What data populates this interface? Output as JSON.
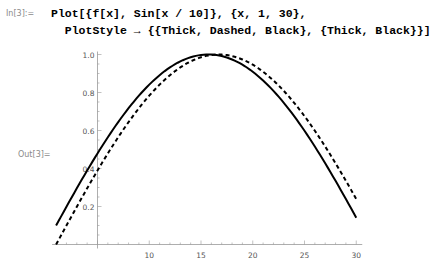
{
  "cell": {
    "input_label": "In[3]:=",
    "output_label": "Out[3]=",
    "code_line1": [
      {
        "t": "Plot[{",
        "k": true
      },
      {
        "t": "f[",
        "k": true
      },
      {
        "t": "x",
        "k": false
      },
      {
        "t": "], ",
        "k": true
      },
      {
        "t": "Sin[",
        "k": true
      },
      {
        "t": "x / 10",
        "k": false
      },
      {
        "t": "]}, {",
        "k": true
      },
      {
        "t": "x",
        "k": false
      },
      {
        "t": ", 1, 30},",
        "k": false
      }
    ],
    "code_line1_text": "Plot[{f[x], Sin[x / 10]}, {x, 1, 30},",
    "code_line2_text": "PlotStyle → {{Thick, Dashed, Black}, {Thick, Black}}]"
  },
  "chart_data": {
    "type": "line",
    "title": "",
    "xlabel": "",
    "ylabel": "",
    "xlim": [
      1,
      30
    ],
    "ylim": [
      0,
      1.0
    ],
    "x_ticks": [
      10,
      15,
      20,
      25,
      30
    ],
    "y_ticks": [
      0.2,
      0.4,
      0.6,
      0.8,
      1.0
    ],
    "axes_origin": [
      5,
      0
    ],
    "grid": false,
    "legend": null,
    "series": [
      {
        "name": "f[x]",
        "style": "thick dashed black",
        "x": [
          1,
          3,
          5,
          7,
          9,
          11,
          13,
          15,
          17,
          19,
          21,
          23,
          25,
          27,
          29,
          30
        ],
        "values": [
          0.0,
          0.199,
          0.389,
          0.565,
          0.717,
          0.841,
          0.932,
          0.985,
          1.0,
          0.974,
          0.909,
          0.808,
          0.675,
          0.516,
          0.335,
          0.239
        ]
      },
      {
        "name": "Sin[x/10]",
        "style": "thick solid black",
        "x": [
          1,
          3,
          5,
          7,
          9,
          11,
          13,
          15,
          17,
          19,
          21,
          23,
          25,
          27,
          29,
          30
        ],
        "values": [
          0.0998,
          0.296,
          0.479,
          0.644,
          0.783,
          0.891,
          0.964,
          0.997,
          0.992,
          0.946,
          0.863,
          0.746,
          0.598,
          0.427,
          0.239,
          0.141
        ]
      }
    ]
  }
}
